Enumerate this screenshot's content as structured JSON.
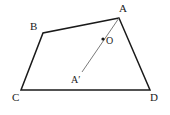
{
  "figure": {
    "background_color": "#ffffff",
    "stroke_color": "#1a1a1a",
    "light_stroke_color": "#6b6b6b",
    "width": 170,
    "height": 115
  },
  "labels": {
    "A": "A",
    "B": "B",
    "C": "C",
    "D": "D",
    "O": "O",
    "A_prime": "A′"
  },
  "points": {
    "A": {
      "x": 119,
      "y": 18
    },
    "B": {
      "x": 43,
      "y": 33
    },
    "C": {
      "x": 21,
      "y": 90
    },
    "D": {
      "x": 150,
      "y": 90
    },
    "O": {
      "x": 103,
      "y": 39
    },
    "A_prime": {
      "x": 82,
      "y": 72
    }
  },
  "edges": {
    "quadrilateral_path": "M 119 18 L 43 33 L 21 90 L 150 90 Z",
    "segment_aprime_a": "M 82 72 L 119 18",
    "quad_stroke_width": 1.5,
    "segment_stroke_width": 0.9
  },
  "markers": {
    "O_dot_radius": 1.6
  }
}
